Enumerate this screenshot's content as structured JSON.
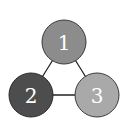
{
  "diagram": {
    "type": "graph",
    "nodes": [
      {
        "id": "1",
        "label": "1",
        "cx": 64,
        "cy": 42,
        "r": 22,
        "fill": "#8c8c8c"
      },
      {
        "id": "2",
        "label": "2",
        "cx": 31,
        "cy": 95,
        "r": 22,
        "fill": "#4d4d4d"
      },
      {
        "id": "3",
        "label": "3",
        "cx": 97,
        "cy": 95,
        "r": 22,
        "fill": "#a9a9a9"
      }
    ],
    "edges": [
      {
        "from": "1",
        "to": "2"
      },
      {
        "from": "1",
        "to": "3"
      },
      {
        "from": "2",
        "to": "3"
      }
    ],
    "edge_color": "#222222",
    "node_stroke": "#3a3a3a"
  }
}
